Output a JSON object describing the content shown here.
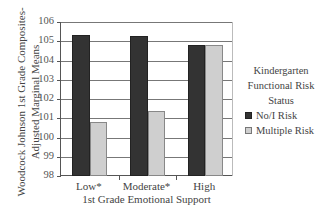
{
  "chart_data": {
    "type": "bar",
    "title": "",
    "xlabel": "1st Grade Emotional Support",
    "ylabel": "Woodcock Johnson 1st Grade Composites-Adjusted Marginal Means",
    "ylabel_lines": [
      "Woodcock Johnson 1st Grade Composites-",
      "Adjusted Marginal Means"
    ],
    "categories": [
      "Low*",
      "Moderate*",
      "High"
    ],
    "series": [
      {
        "name": "No/I Risk",
        "color": "#333333",
        "values": [
          105.3,
          105.25,
          104.8
        ]
      },
      {
        "name": "Multiple Risk",
        "color": "#cfcfcf",
        "values": [
          100.8,
          101.4,
          104.8
        ]
      }
    ],
    "ylim": [
      98,
      106
    ],
    "yticks": [
      98,
      99,
      100,
      101,
      102,
      103,
      104,
      105,
      106
    ],
    "grid": true,
    "legend": {
      "position": "right",
      "title_lines": [
        "Kindergarten",
        "Functional Risk",
        "Status"
      ],
      "entries": [
        "No/I Risk",
        "Multiple Risk"
      ]
    }
  }
}
